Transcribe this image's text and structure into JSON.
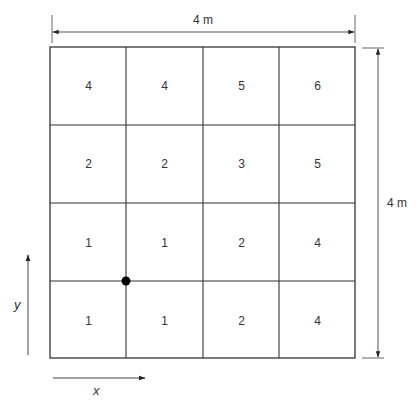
{
  "diagram": {
    "width_dimension": "4 m",
    "height_dimension": "4 m",
    "x_axis_label": "x",
    "y_axis_label": "y",
    "grid": {
      "rows": 4,
      "cols": 4,
      "cells": [
        [
          "4",
          "4",
          "5",
          "6"
        ],
        [
          "2",
          "2",
          "3",
          "5"
        ],
        [
          "1",
          "1",
          "2",
          "4"
        ],
        [
          "1",
          "1",
          "2",
          "4"
        ]
      ]
    },
    "marker": {
      "type": "dot",
      "position": "intersection of column line 1 and row line 3 (bottom-left interior node)"
    },
    "colors": {
      "line": "#333333",
      "background": "#ffffff",
      "dot": "#000000"
    }
  }
}
